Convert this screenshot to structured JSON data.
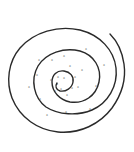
{
  "diagram": {
    "type": "spiral",
    "stroke_color": "#2a2a2a",
    "background": "#ffffff",
    "mark_glyph": "*",
    "marks": [
      {
        "x": 86,
        "y": 51
      },
      {
        "x": 104,
        "y": 67
      },
      {
        "x": 96,
        "y": 88
      },
      {
        "x": 90,
        "y": 111
      },
      {
        "x": 66,
        "y": 114
      },
      {
        "x": 47,
        "y": 117
      },
      {
        "x": 40,
        "y": 101
      },
      {
        "x": 29,
        "y": 89
      },
      {
        "x": 37,
        "y": 77
      },
      {
        "x": 39,
        "y": 62
      },
      {
        "x": 52,
        "y": 62
      },
      {
        "x": 64,
        "y": 58
      },
      {
        "x": 70,
        "y": 68
      },
      {
        "x": 82,
        "y": 72
      },
      {
        "x": 75,
        "y": 79
      },
      {
        "x": 78,
        "y": 89
      },
      {
        "x": 72,
        "y": 90
      },
      {
        "x": 67,
        "y": 97
      },
      {
        "x": 61,
        "y": 91
      },
      {
        "x": 55,
        "y": 93
      },
      {
        "x": 51,
        "y": 82
      },
      {
        "x": 58,
        "y": 79
      },
      {
        "x": 64,
        "y": 80
      },
      {
        "x": 57,
        "y": 86
      }
    ]
  }
}
